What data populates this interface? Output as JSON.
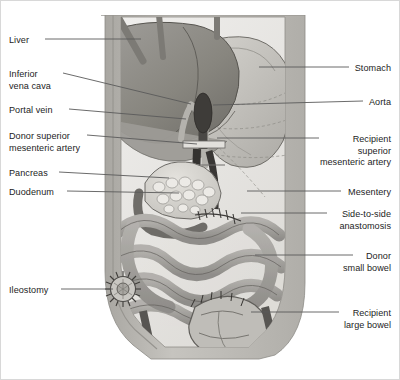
{
  "figure": {
    "type": "medical-anatomical-diagram",
    "style": "grayscale line-and-tone drawing",
    "panel": {
      "x": 98,
      "y": 14,
      "width": 208,
      "height": 345
    },
    "colors": {
      "page_background": "#ffffff",
      "border": "#d8d8d8",
      "label_text": "#1d1d1d",
      "leader_line": "#5a5a5a",
      "abdominal_wall": "#b9b7b2",
      "peritoneal_cavity": "#e9e8e6",
      "liver": "#8e8c89",
      "liver_shadow": "#6f6d6b",
      "stomach": "#c2c0bc",
      "bowel": "#9c9a96",
      "bowel_light": "#bdbbb7",
      "vessel_dark": "#3a3938",
      "vessel_mid": "#6b6966",
      "pancreas": "#d7d5d0",
      "outline": "#4a4846"
    }
  },
  "labels": {
    "left": [
      {
        "id": "liver",
        "text": "Liver",
        "lines": [
          "Liver"
        ],
        "text_x": 8,
        "text_y": 34,
        "leader_from": [
          44,
          38
        ],
        "leader_to": [
          140,
          38
        ]
      },
      {
        "id": "inferior-vena-cava",
        "text": "Inferior vena cava",
        "lines": [
          "Inferior",
          "vena cava"
        ],
        "text_x": 8,
        "text_y": 68,
        "leader_from": [
          62,
          72
        ],
        "leader_to": [
          190,
          103
        ]
      },
      {
        "id": "portal-vein",
        "text": "Portal vein",
        "lines": [
          "Portal vein"
        ],
        "text_x": 8,
        "text_y": 104,
        "leader_from": [
          68,
          108
        ],
        "leader_to": [
          185,
          118
        ]
      },
      {
        "id": "donor-superior-mesenteric-artery",
        "text": "Donor superior mesenteric artery",
        "lines": [
          "Donor superior",
          "mesenteric artery"
        ],
        "text_x": 8,
        "text_y": 130,
        "leader_from": [
          86,
          134
        ],
        "leader_to": [
          196,
          143
        ]
      },
      {
        "id": "pancreas",
        "text": "Pancreas",
        "lines": [
          "Pancreas"
        ],
        "text_x": 8,
        "text_y": 167,
        "leader_from": [
          58,
          171
        ],
        "leader_to": [
          168,
          177
        ]
      },
      {
        "id": "duodenum",
        "text": "Duodenum",
        "lines": [
          "Duodenum"
        ],
        "text_x": 8,
        "text_y": 186,
        "leader_from": [
          66,
          190
        ],
        "leader_to": [
          178,
          192
        ]
      },
      {
        "id": "ileostomy",
        "text": "Ileostomy",
        "lines": [
          "Ileostomy"
        ],
        "text_x": 8,
        "text_y": 284,
        "leader_from": [
          60,
          288
        ],
        "leader_to": [
          112,
          288
        ]
      }
    ],
    "right": [
      {
        "id": "stomach",
        "text": "Stomach",
        "lines": [
          "Stomach"
        ],
        "text_x": 392,
        "text_y": 62,
        "leader_from": [
          348,
          66
        ],
        "leader_to": [
          258,
          66
        ]
      },
      {
        "id": "aorta",
        "text": "Aorta",
        "lines": [
          "Aorta"
        ],
        "text_x": 392,
        "text_y": 96,
        "leader_from": [
          362,
          100
        ],
        "leader_to": [
          212,
          104
        ]
      },
      {
        "id": "recipient-superior-mesenteric-artery",
        "text": "Recipient superior mesenteric artery",
        "lines": [
          "Recipient",
          "superior",
          "mesenteric artery"
        ],
        "text_x": 392,
        "text_y": 133,
        "leader_from": [
          318,
          137
        ],
        "leader_to": [
          216,
          137
        ]
      },
      {
        "id": "mesentery",
        "text": "Mesentery",
        "lines": [
          "Mesentery"
        ],
        "text_x": 392,
        "text_y": 186,
        "leader_from": [
          340,
          190
        ],
        "leader_to": [
          246,
          190
        ]
      },
      {
        "id": "side-to-side-anastomosis",
        "text": "Side-to-side anastomosis",
        "lines": [
          "Side-to-side",
          "anastomosis"
        ],
        "text_x": 392,
        "text_y": 208,
        "leader_from": [
          326,
          212
        ],
        "leader_to": [
          240,
          212
        ]
      },
      {
        "id": "donor-small-bowel",
        "text": "Donor small bowel",
        "lines": [
          "Donor",
          "small bowel"
        ],
        "text_x": 392,
        "text_y": 250,
        "leader_from": [
          352,
          254
        ],
        "leader_to": [
          254,
          254
        ]
      },
      {
        "id": "recipient-large-bowel",
        "text": "Recipient large bowel",
        "lines": [
          "Recipient",
          "large bowel"
        ],
        "text_x": 392,
        "text_y": 307,
        "leader_from": [
          338,
          311
        ],
        "leader_to": [
          250,
          311
        ]
      }
    ]
  },
  "structures": [
    {
      "id": "abdominal-wall",
      "name": "Abdominal wall"
    },
    {
      "id": "liver-organ",
      "name": "Liver"
    },
    {
      "id": "stomach-organ",
      "name": "Stomach"
    },
    {
      "id": "pancreas-organ",
      "name": "Pancreas"
    },
    {
      "id": "duodenum-organ",
      "name": "Duodenum"
    },
    {
      "id": "small-bowel-loops",
      "name": "Donor small bowel loops"
    },
    {
      "id": "large-bowel-organ",
      "name": "Recipient large bowel"
    },
    {
      "id": "aorta-vessel",
      "name": "Aorta"
    },
    {
      "id": "inferior-vena-cava-vessel",
      "name": "Inferior vena cava"
    },
    {
      "id": "portal-vein-vessel",
      "name": "Portal vein"
    },
    {
      "id": "smа-vessel",
      "name": "Superior mesenteric artery"
    },
    {
      "id": "ileostomy-stoma",
      "name": "Ileostomy stoma"
    },
    {
      "id": "anastomosis-suture-line",
      "name": "Side-to-side anastomosis suture line"
    }
  ]
}
